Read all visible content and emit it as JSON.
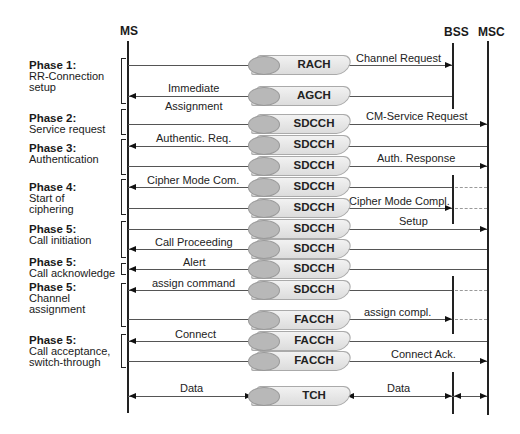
{
  "entities": {
    "ms": "MS",
    "bss": "BSS",
    "msc": "MSC"
  },
  "phases": [
    {
      "title": "Phase 1:",
      "lines": [
        "RR-Connection",
        "setup"
      ]
    },
    {
      "title": "Phase 2:",
      "lines": [
        "Service request"
      ]
    },
    {
      "title": "Phase 3:",
      "lines": [
        "Authentication"
      ]
    },
    {
      "title": "Phase 4:",
      "lines": [
        "Start of",
        "ciphering"
      ]
    },
    {
      "title": "Phase 5:",
      "lines": [
        "Call initiation"
      ]
    },
    {
      "title": "Phase 5:",
      "lines": [
        "Call acknowledge"
      ]
    },
    {
      "title": "Phase 5:",
      "lines": [
        "Channel",
        "assignment"
      ]
    },
    {
      "title": "Phase 5:",
      "lines": [
        "Call acceptance,",
        "switch-through"
      ]
    }
  ],
  "channels": [
    "RACH",
    "AGCH",
    "SDCCH",
    "SDCCH",
    "SDCCH",
    "SDCCH",
    "SDCCH",
    "SDCCH",
    "SDCCH",
    "SDCCH",
    "SDCCH",
    "SDCCH",
    "FACCH",
    "FACCH",
    "FACCH",
    "TCH"
  ],
  "messages": {
    "channel_request": "Channel Request",
    "immediate": "Immediate",
    "assignment": "Assignment",
    "cm_service_request": "CM-Service Request",
    "authentic_req": "Authentic. Req.",
    "auth_response": "Auth. Response",
    "cipher_mode_com": "Cipher Mode Com.",
    "cipher_mode_compl": "Cipher Mode Compl.",
    "setup": "Setup",
    "call_proceeding": "Call Proceeding",
    "alert": "Alert",
    "assign_command": "assign command",
    "assign_compl": "assign compl.",
    "connect": "Connect",
    "connect_ack": "Connect Ack.",
    "data_left": "Data",
    "data_right": "Data"
  }
}
